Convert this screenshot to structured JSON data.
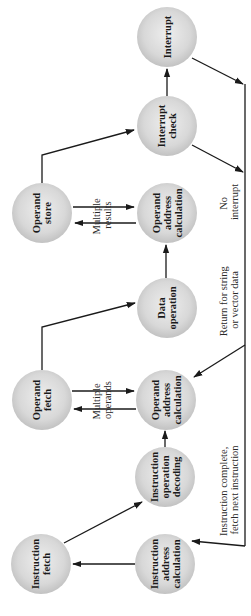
{
  "diagram": {
    "title": "",
    "orientation": "rotated-90-ccw",
    "colors": {
      "node_fill_center": "#ececec",
      "node_fill_edge": "#c4c4c4",
      "edge": "#1a1a1a",
      "text": "#1a1a1a",
      "background": "#ffffff"
    },
    "nodes": [
      {
        "id": "interrupt",
        "lines": [
          "Interrupt"
        ],
        "cx": 167,
        "cy": 37
      },
      {
        "id": "interrupt_check",
        "lines": [
          "Interrupt",
          "check"
        ],
        "cx": 167,
        "cy": 126
      },
      {
        "id": "operand_store",
        "lines": [
          "Operand",
          "store"
        ],
        "cx": 42,
        "cy": 213
      },
      {
        "id": "operand_address_calc_top",
        "lines": [
          "Operand",
          "address",
          "calculation"
        ],
        "cx": 167,
        "cy": 213
      },
      {
        "id": "data_operation",
        "lines": [
          "Data",
          "operation"
        ],
        "cx": 167,
        "cy": 308
      },
      {
        "id": "operand_fetch",
        "lines": [
          "Operand",
          "fetch"
        ],
        "cx": 42,
        "cy": 400
      },
      {
        "id": "operand_address_calc_bottom",
        "lines": [
          "Operand",
          "address",
          "calculation"
        ],
        "cx": 166,
        "cy": 400
      },
      {
        "id": "instruction_operation_decoding",
        "lines": [
          "Instruction",
          "operation",
          "decoding"
        ],
        "cx": 165,
        "cy": 477
      },
      {
        "id": "instruction_fetch",
        "lines": [
          "Instruction",
          "fetch"
        ],
        "cx": 41,
        "cy": 564
      },
      {
        "id": "instruction_address_calc",
        "lines": [
          "Instruction",
          "address",
          "calculation"
        ],
        "cx": 165,
        "cy": 564
      }
    ],
    "edge_labels": {
      "multiple_results": [
        "Multiple",
        "results"
      ],
      "multiple_operands": [
        "Multiple",
        "operands"
      ],
      "no_interrupt": [
        "No",
        "interrupt"
      ],
      "return_for_string": [
        "Return for string",
        "or vector data"
      ],
      "instruction_complete": [
        "Instruction complete,",
        "fetch next instruction"
      ]
    }
  }
}
